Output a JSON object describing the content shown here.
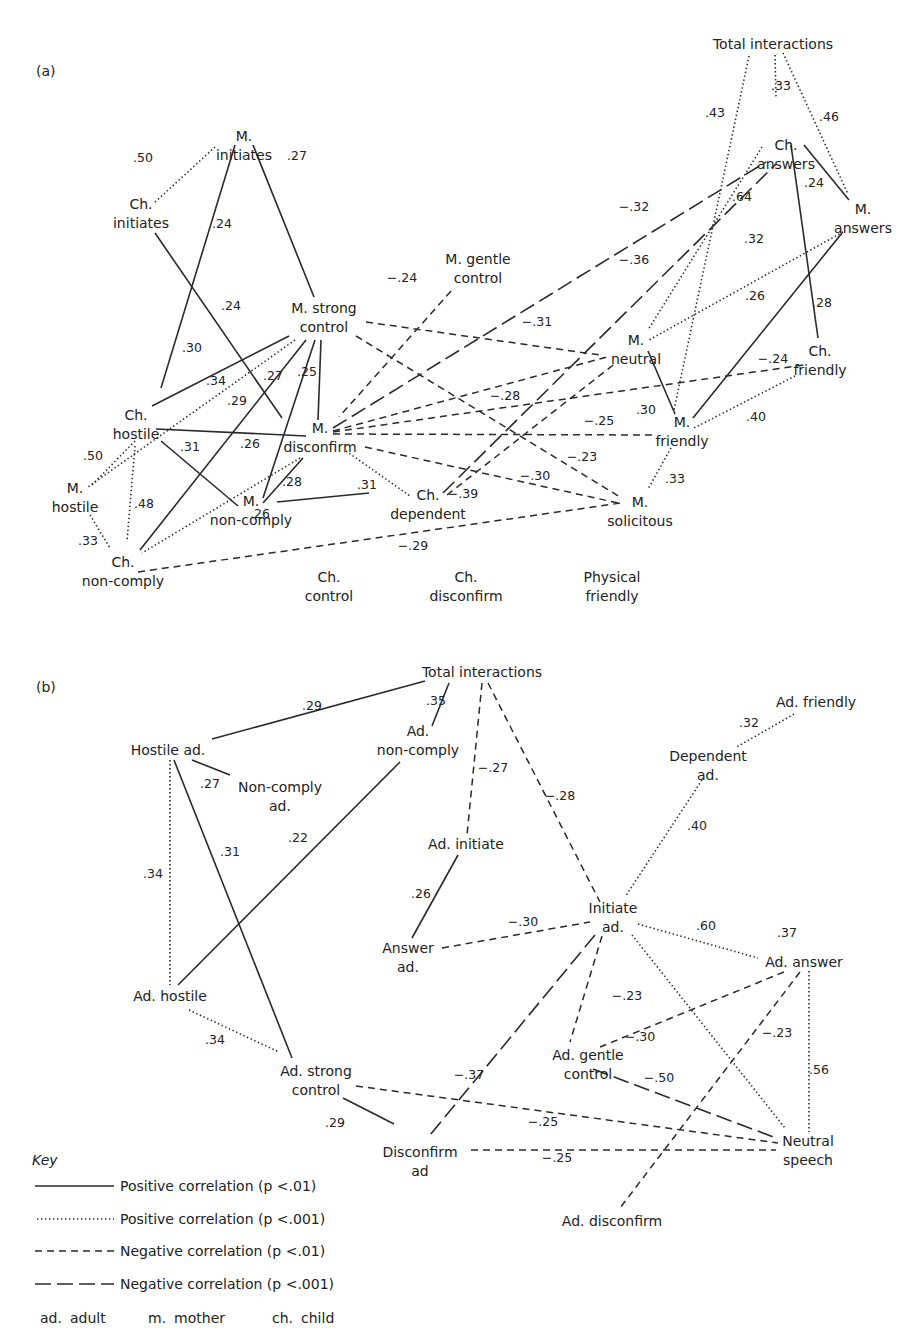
{
  "figure": {
    "panels": [
      {
        "id": "a",
        "label": "(a)",
        "nodes": [
          {
            "id": "m_initiates",
            "lines": [
              "M.",
              "initiates"
            ]
          },
          {
            "id": "ch_initiates",
            "lines": [
              "Ch.",
              "initiates"
            ]
          },
          {
            "id": "m_strong_control",
            "lines": [
              "M. strong",
              "control"
            ]
          },
          {
            "id": "m_gentle_control",
            "lines": [
              "M. gentle",
              "control"
            ]
          },
          {
            "id": "ch_hostile",
            "lines": [
              "Ch.",
              "hostile"
            ]
          },
          {
            "id": "m_hostile",
            "lines": [
              "M.",
              "hostile"
            ]
          },
          {
            "id": "m_disconfirm",
            "lines": [
              "M.",
              "disconfirm"
            ]
          },
          {
            "id": "m_non_comply",
            "lines": [
              "M.",
              "non-comply"
            ]
          },
          {
            "id": "ch_non_comply",
            "lines": [
              "Ch.",
              "non-comply"
            ]
          },
          {
            "id": "ch_dependent",
            "lines": [
              "Ch.",
              "dependent"
            ]
          },
          {
            "id": "total_interactions",
            "lines": [
              "Total interactions"
            ]
          },
          {
            "id": "ch_answers",
            "lines": [
              "Ch.",
              "answers"
            ]
          },
          {
            "id": "m_answers",
            "lines": [
              "M.",
              "answers"
            ]
          },
          {
            "id": "m_neutral",
            "lines": [
              "M.",
              "neutral"
            ]
          },
          {
            "id": "ch_friendly",
            "lines": [
              "Ch.",
              "friendly"
            ]
          },
          {
            "id": "m_friendly",
            "lines": [
              "M.",
              "friendly"
            ]
          },
          {
            "id": "m_solicitous",
            "lines": [
              "M.",
              "solicitous"
            ]
          },
          {
            "id": "ch_control",
            "lines": [
              "Ch.",
              "control"
            ]
          },
          {
            "id": "ch_disconfirm",
            "lines": [
              "Ch.",
              "disconfirm"
            ]
          },
          {
            "id": "physical_friendly",
            "lines": [
              "Physical",
              "friendly"
            ]
          }
        ],
        "edges": [
          {
            "from": "m_initiates",
            "to": "ch_initiates",
            "value": ".50",
            "type": "pos001"
          },
          {
            "from": "m_initiates",
            "to": "ch_hostile",
            "value": ".24",
            "type": "pos01"
          },
          {
            "from": "m_initiates",
            "to": "m_strong_control",
            "value": ".27",
            "type": "pos01"
          },
          {
            "from": "ch_initiates",
            "to": "m_disconfirm",
            "value": ".24",
            "type": "pos01"
          },
          {
            "from": "m_strong_control",
            "to": "ch_hostile",
            "value": ".30",
            "type": "pos01"
          },
          {
            "from": "m_strong_control",
            "to": "m_hostile",
            "value": ".34",
            "type": "pos001"
          },
          {
            "from": "m_strong_control",
            "to": "ch_non_comply",
            "value": ".29",
            "type": "pos01"
          },
          {
            "from": "m_strong_control",
            "to": "m_non_comply",
            "value": ".27",
            "type": "pos01"
          },
          {
            "from": "m_strong_control",
            "to": "m_disconfirm",
            "value": ".25",
            "type": "pos01"
          },
          {
            "from": "m_strong_control",
            "to": "m_neutral",
            "value": "−.31",
            "type": "neg01"
          },
          {
            "from": "m_strong_control",
            "to": "m_solicitous",
            "value": "−.23",
            "type": "neg01"
          },
          {
            "from": "m_gentle_control",
            "to": "m_disconfirm",
            "value": "−.24",
            "type": "neg01"
          },
          {
            "from": "ch_hostile",
            "to": "m_disconfirm",
            "value": ".26",
            "type": "pos01"
          },
          {
            "from": "ch_hostile",
            "to": "m_non_comply",
            "value": ".31",
            "type": "pos01"
          },
          {
            "from": "ch_hostile",
            "to": "m_hostile",
            "value": ".50",
            "type": "pos001"
          },
          {
            "from": "ch_hostile",
            "to": "ch_non_comply",
            "value": ".48",
            "type": "pos001"
          },
          {
            "from": "m_hostile",
            "to": "ch_non_comply",
            "value": ".33",
            "type": "pos001"
          },
          {
            "from": "m_disconfirm",
            "to": "m_non_comply",
            "value": ".28",
            "type": "pos01"
          },
          {
            "from": "m_disconfirm",
            "to": "ch_non_comply",
            "value": "",
            "type": "pos001"
          },
          {
            "from": "m_disconfirm",
            "to": "ch_dependent",
            "value": ".31",
            "type": "pos001"
          },
          {
            "from": "m_disconfirm",
            "to": "m_neutral",
            "value": "−.28",
            "type": "neg01"
          },
          {
            "from": "m_disconfirm",
            "to": "ch_friendly",
            "value": "−.24",
            "type": "neg01"
          },
          {
            "from": "m_disconfirm",
            "to": "m_friendly",
            "value": "−.25",
            "type": "neg01"
          },
          {
            "from": "m_disconfirm",
            "to": "m_solicitous",
            "value": "−.30",
            "type": "neg01"
          },
          {
            "from": "m_disconfirm",
            "to": "ch_answers",
            "value": "−.32",
            "type": "neg001"
          },
          {
            "from": "m_non_comply",
            "to": "ch_non_comply",
            "value": ".26",
            "type": "pos01"
          },
          {
            "from": "ch_non_comply",
            "to": "m_solicitous",
            "value": "−.29",
            "type": "neg01"
          },
          {
            "from": "ch_dependent",
            "to": "m_neutral",
            "value": "−.39",
            "type": "neg01"
          },
          {
            "from": "ch_dependent",
            "to": "ch_answers",
            "value": "−.36",
            "type": "neg001"
          },
          {
            "from": "total_interactions",
            "to": "ch_answers",
            "value": ".33",
            "type": "pos001"
          },
          {
            "from": "total_interactions",
            "to": "m_answers",
            "value": ".46",
            "type": "pos001"
          },
          {
            "from": "total_interactions",
            "to": "m_friendly",
            "value": ".43",
            "type": "pos001"
          },
          {
            "from": "ch_answers",
            "to": "m_answers",
            "value": ".24",
            "type": "pos01"
          },
          {
            "from": "ch_answers",
            "to": "m_neutral",
            "value": ".64",
            "type": "pos001"
          },
          {
            "from": "ch_answers",
            "to": "ch_friendly",
            "value": ".28",
            "type": "pos01"
          },
          {
            "from": "m_answers",
            "to": "m_neutral",
            "value": ".32",
            "type": "pos001"
          },
          {
            "from": "m_answers",
            "to": "m_friendly",
            "value": ".26",
            "type": "pos01"
          },
          {
            "from": "m_neutral",
            "to": "m_friendly",
            "value": ".30",
            "type": "pos01"
          },
          {
            "from": "ch_friendly",
            "to": "m_friendly",
            "value": ".40",
            "type": "pos001"
          },
          {
            "from": "m_friendly",
            "to": "m_solicitous",
            "value": ".33",
            "type": "pos001"
          }
        ]
      },
      {
        "id": "b",
        "label": "(b)",
        "nodes": [
          {
            "id": "total_interactions",
            "lines": [
              "Total interactions"
            ]
          },
          {
            "id": "hostile_ad",
            "lines": [
              "Hostile ad."
            ]
          },
          {
            "id": "non_comply_ad",
            "lines": [
              "Non-comply",
              "ad."
            ]
          },
          {
            "id": "ad_non_comply",
            "lines": [
              "Ad.",
              "non-comply"
            ]
          },
          {
            "id": "ad_initiate",
            "lines": [
              "Ad. initiate"
            ]
          },
          {
            "id": "answer_ad",
            "lines": [
              "Answer",
              "ad."
            ]
          },
          {
            "id": "ad_friendly",
            "lines": [
              "Ad. friendly"
            ]
          },
          {
            "id": "dependent_ad",
            "lines": [
              "Dependent",
              "ad."
            ]
          },
          {
            "id": "initiate_ad",
            "lines": [
              "Initiate",
              "ad."
            ]
          },
          {
            "id": "ad_answer",
            "lines": [
              "Ad. answer"
            ]
          },
          {
            "id": "ad_hostile",
            "lines": [
              "Ad. hostile"
            ]
          },
          {
            "id": "ad_strong_control",
            "lines": [
              "Ad. strong",
              "control"
            ]
          },
          {
            "id": "ad_gentle_control",
            "lines": [
              "Ad. gentle",
              "control"
            ]
          },
          {
            "id": "disconfirm_ad",
            "lines": [
              "Disconfirm",
              "ad"
            ]
          },
          {
            "id": "neutral_speech",
            "lines": [
              "Neutral",
              "speech"
            ]
          },
          {
            "id": "ad_disconfirm",
            "lines": [
              "Ad. disconfirm"
            ]
          }
        ],
        "edges": [
          {
            "from": "total_interactions",
            "to": "hostile_ad",
            "value": ".29",
            "type": "pos01"
          },
          {
            "from": "total_interactions",
            "to": "ad_non_comply",
            "value": ".35",
            "type": "pos01"
          },
          {
            "from": "total_interactions",
            "to": "ad_initiate",
            "value": "−.27",
            "type": "neg01"
          },
          {
            "from": "total_interactions",
            "to": "initiate_ad",
            "value": "−.28",
            "type": "neg01"
          },
          {
            "from": "hostile_ad",
            "to": "non_comply_ad",
            "value": ".27",
            "type": "pos01"
          },
          {
            "from": "hostile_ad",
            "to": "ad_hostile",
            "value": ".34",
            "type": "pos001"
          },
          {
            "from": "hostile_ad",
            "to": "ad_strong_control",
            "value": ".31",
            "type": "pos01"
          },
          {
            "from": "ad_non_comply",
            "to": "ad_hostile",
            "value": ".22",
            "type": "pos01"
          },
          {
            "from": "ad_initiate",
            "to": "answer_ad",
            "value": ".26",
            "type": "pos01"
          },
          {
            "from": "answer_ad",
            "to": "initiate_ad",
            "value": "−.30",
            "type": "neg01"
          },
          {
            "from": "ad_friendly",
            "to": "dependent_ad",
            "value": ".32",
            "type": "pos001"
          },
          {
            "from": "dependent_ad",
            "to": "initiate_ad",
            "value": ".40",
            "type": "pos001"
          },
          {
            "from": "initiate_ad",
            "to": "ad_answer",
            "value": ".60",
            "type": "pos001"
          },
          {
            "from": "initiate_ad",
            "to": "neutral_speech",
            "value": ".37",
            "type": "pos001"
          },
          {
            "from": "initiate_ad",
            "to": "ad_gentle_control",
            "value": "−.23",
            "type": "neg01"
          },
          {
            "from": "initiate_ad",
            "to": "disconfirm_ad",
            "value": "−.37",
            "type": "neg001"
          },
          {
            "from": "ad_hostile",
            "to": "ad_strong_control",
            "value": ".34",
            "type": "pos001"
          },
          {
            "from": "ad_strong_control",
            "to": "disconfirm_ad",
            "value": ".29",
            "type": "pos01"
          },
          {
            "from": "ad_strong_control",
            "to": "neutral_speech",
            "value": "−.25",
            "type": "neg01"
          },
          {
            "from": "disconfirm_ad",
            "to": "neutral_speech",
            "value": "−.25",
            "type": "neg01"
          },
          {
            "from": "ad_answer",
            "to": "ad_gentle_control",
            "value": "−.30",
            "type": "neg01"
          },
          {
            "from": "ad_answer",
            "to": "ad_disconfirm",
            "value": "−.23",
            "type": "neg01"
          },
          {
            "from": "ad_answer",
            "to": "neutral_speech",
            "value": ".56",
            "type": "pos001"
          },
          {
            "from": "ad_gentle_control",
            "to": "neutral_speech",
            "value": "−.50",
            "type": "neg001"
          }
        ]
      }
    ],
    "key": {
      "title": "Key",
      "items": [
        {
          "type": "pos01",
          "label": "Positive correlation (p <.01)"
        },
        {
          "type": "pos001",
          "label": "Positive correlation (p <.001)"
        },
        {
          "type": "neg01",
          "label": "Negative correlation (p <.01)"
        },
        {
          "type": "neg001",
          "label": "Negative correlation (p <.001)"
        }
      ],
      "abbreviations": [
        {
          "abbr": "ad.",
          "meaning": "adult"
        },
        {
          "abbr": "m.",
          "meaning": "mother"
        },
        {
          "abbr": "ch.",
          "meaning": "child"
        }
      ]
    }
  }
}
